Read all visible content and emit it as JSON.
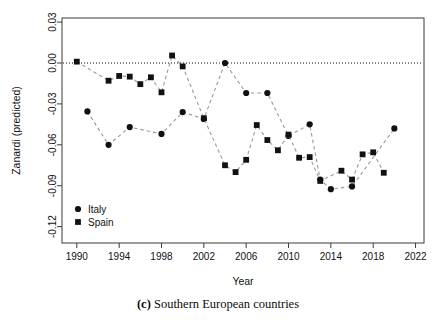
{
  "chart_data": {
    "type": "line",
    "title": "",
    "xlabel": "Year",
    "ylabel": "Zanardi (predicted)",
    "xlim": [
      1988.6,
      2022.8
    ],
    "ylim": [
      -0.132,
      0.033
    ],
    "xticks": [
      1990,
      1994,
      1998,
      2002,
      2006,
      2010,
      2014,
      2018,
      2022
    ],
    "yticks": [
      0.03,
      0.0,
      -0.03,
      -0.06,
      -0.09,
      -0.12
    ],
    "xtick_labels": [
      "1990",
      "1994",
      "1998",
      "2002",
      "2006",
      "2010",
      "2014",
      "2018",
      "2022"
    ],
    "ytick_labels": [
      "0.03",
      "0.00",
      "-0.03",
      "-0.06",
      "-0.09",
      "-0.12"
    ],
    "grid": false,
    "reference_line": {
      "y": 0.0,
      "style": "dotted"
    },
    "legend_position": "bottom-left",
    "line_style": "dashed",
    "line_color": "#9a9a9a",
    "marker_color": "#111111",
    "series": [
      {
        "name": "Italy",
        "marker": "circle",
        "x": [
          1991,
          1993,
          1995,
          1998,
          2000,
          2002,
          2004,
          2006,
          2008,
          2010,
          2012,
          2013,
          2014,
          2016,
          2020
        ],
        "values": [
          -0.0355,
          -0.06,
          -0.047,
          -0.052,
          -0.036,
          -0.041,
          0.0,
          -0.022,
          -0.022,
          -0.0535,
          -0.045,
          -0.0855,
          -0.0925,
          -0.0905,
          -0.048
        ]
      },
      {
        "name": "Spain",
        "marker": "square",
        "x": [
          1990,
          1993,
          1994,
          1995,
          1996,
          1997,
          1998,
          1999,
          2000,
          2002,
          2004,
          2005,
          2006,
          2007,
          2008,
          2009,
          2010,
          2011,
          2012,
          2013,
          2015,
          2016,
          2017,
          2018,
          2019
        ],
        "values": [
          0.001,
          -0.013,
          -0.0095,
          -0.01,
          -0.0155,
          -0.0105,
          -0.0215,
          0.0055,
          -0.0025,
          -0.0405,
          -0.075,
          -0.08,
          -0.071,
          -0.0455,
          -0.0565,
          -0.064,
          -0.0525,
          -0.0695,
          -0.069,
          -0.0865,
          -0.079,
          -0.0855,
          -0.067,
          -0.0655,
          -0.0805
        ]
      }
    ]
  },
  "legend": {
    "items": [
      {
        "label": "Italy",
        "marker": "circle"
      },
      {
        "label": "Spain",
        "marker": "square"
      }
    ]
  },
  "caption": {
    "tag": "(c)",
    "text": " Southern European countries"
  }
}
